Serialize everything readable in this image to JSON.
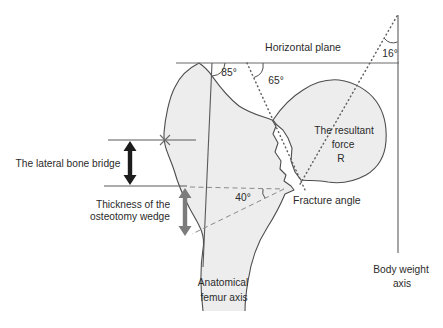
{
  "figure": {
    "title_context": "Proximal femur osteotomy diagram",
    "labels": {
      "horizontal_plane": "Horizontal plane",
      "angle_femur_axis": "85°",
      "angle_neck_axis": "65°",
      "angle_resultant": "16°",
      "resultant_force_line1": "The resultant",
      "resultant_force_line2": "force",
      "resultant_force_line3": "R",
      "lateral_bone_bridge": "The lateral bone bridge",
      "osteotomy_thickness_line1": "Thickness of the",
      "osteotomy_thickness_line2": "osteotomy wedge",
      "fracture_angle_value": "40°",
      "fracture_angle": "Fracture angle",
      "anatomical_axis_line1": "Anatomical",
      "anatomical_axis_line2": "femur axis",
      "body_weight_axis_line1": "Body weight",
      "body_weight_axis_line2": "axis"
    },
    "colors": {
      "background": "#ffffff",
      "bone_fill": "#ededed",
      "outline": "#4d4d4d",
      "text": "#2b2b2b",
      "bridge_arrow": "#1c1c1c",
      "wedge_arrow": "#7c7c7c"
    }
  }
}
